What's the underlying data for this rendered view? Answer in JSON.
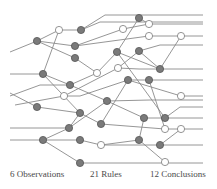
{
  "labels": {
    "observations": "6 Observations",
    "rules": "21 Rules",
    "conclusions": "12 Conclusions"
  },
  "colors": {
    "line": "#8a8a8a",
    "gray_node_fill": "#7a7a7a",
    "gray_node_stroke": "#555555",
    "white_node_fill": "#ffffff",
    "white_node_stroke": "#7a7a7a"
  },
  "nodes": [
    {
      "id": "a",
      "x": 37,
      "y": 41,
      "type": "gray"
    },
    {
      "id": "b",
      "x": 59,
      "y": 30,
      "type": "white"
    },
    {
      "id": "c",
      "x": 81,
      "y": 30,
      "type": "gray"
    },
    {
      "id": "d",
      "x": 75,
      "y": 46,
      "type": "gray"
    },
    {
      "id": "e",
      "x": 75,
      "y": 58,
      "type": "gray"
    },
    {
      "id": "f",
      "x": 43,
      "y": 74,
      "type": "gray"
    },
    {
      "id": "g",
      "x": 97,
      "y": 73,
      "type": "white"
    },
    {
      "id": "h",
      "x": 70,
      "y": 85,
      "type": "gray"
    },
    {
      "id": "i",
      "x": 64,
      "y": 96,
      "type": "white"
    },
    {
      "id": "j",
      "x": 139,
      "y": 18,
      "type": "gray"
    },
    {
      "id": "k",
      "x": 149,
      "y": 24,
      "type": "white"
    },
    {
      "id": "l",
      "x": 123,
      "y": 29,
      "type": "white"
    },
    {
      "id": "m",
      "x": 149,
      "y": 36,
      "type": "white"
    },
    {
      "id": "n",
      "x": 181,
      "y": 36,
      "type": "white"
    },
    {
      "id": "o",
      "x": 117,
      "y": 52,
      "type": "gray"
    },
    {
      "id": "p",
      "x": 139,
      "y": 51,
      "type": "gray"
    },
    {
      "id": "q",
      "x": 118,
      "y": 68,
      "type": "white"
    },
    {
      "id": "r",
      "x": 160,
      "y": 69,
      "type": "gray"
    },
    {
      "id": "s",
      "x": 128,
      "y": 80,
      "type": "gray"
    },
    {
      "id": "t",
      "x": 149,
      "y": 80,
      "type": "gray"
    },
    {
      "id": "u",
      "x": 107,
      "y": 101,
      "type": "gray"
    },
    {
      "id": "v",
      "x": 37,
      "y": 107,
      "type": "gray"
    },
    {
      "id": "w",
      "x": 80,
      "y": 113,
      "type": "gray"
    },
    {
      "id": "x",
      "x": 69,
      "y": 128,
      "type": "gray"
    },
    {
      "id": "y",
      "x": 101,
      "y": 124,
      "type": "gray"
    },
    {
      "id": "z",
      "x": 43,
      "y": 140,
      "type": "gray"
    },
    {
      "id": "aa",
      "x": 80,
      "y": 140,
      "type": "gray"
    },
    {
      "id": "ab",
      "x": 101,
      "y": 145,
      "type": "white"
    },
    {
      "id": "ac",
      "x": 80,
      "y": 163,
      "type": "gray"
    },
    {
      "id": "ad",
      "x": 181,
      "y": 96,
      "type": "white"
    },
    {
      "id": "ae",
      "x": 144,
      "y": 118,
      "type": "gray"
    },
    {
      "id": "af",
      "x": 165,
      "y": 118,
      "type": "gray"
    },
    {
      "id": "ag",
      "x": 165,
      "y": 129,
      "type": "white"
    },
    {
      "id": "ah",
      "x": 181,
      "y": 129,
      "type": "white"
    },
    {
      "id": "ai",
      "x": 139,
      "y": 140,
      "type": "gray"
    },
    {
      "id": "aj",
      "x": 160,
      "y": 145,
      "type": "gray"
    },
    {
      "id": "ak",
      "x": 165,
      "y": 162,
      "type": "white"
    }
  ],
  "edges": [
    [
      10,
      52,
      37,
      41
    ],
    [
      37,
      41,
      59,
      30
    ],
    [
      59,
      30,
      81,
      30
    ],
    [
      37,
      41,
      75,
      46
    ],
    [
      37,
      41,
      75,
      58
    ],
    [
      59,
      30,
      43,
      74
    ],
    [
      81,
      30,
      105,
      15
    ],
    [
      105,
      15,
      203,
      15
    ],
    [
      139,
      18,
      149,
      24
    ],
    [
      81,
      30,
      100,
      22
    ],
    [
      100,
      22,
      203,
      22
    ],
    [
      75,
      46,
      123,
      29
    ],
    [
      123,
      29,
      149,
      24
    ],
    [
      149,
      24,
      203,
      24
    ],
    [
      75,
      46,
      149,
      36
    ],
    [
      149,
      36,
      181,
      36
    ],
    [
      181,
      36,
      203,
      36
    ],
    [
      75,
      58,
      97,
      73
    ],
    [
      97,
      73,
      117,
      52
    ],
    [
      117,
      52,
      139,
      18
    ],
    [
      10,
      74,
      43,
      74
    ],
    [
      43,
      74,
      70,
      85
    ],
    [
      70,
      85,
      107,
      101
    ],
    [
      43,
      74,
      80,
      113
    ],
    [
      10,
      96,
      40,
      85
    ],
    [
      40,
      85,
      70,
      85
    ],
    [
      70,
      85,
      97,
      73
    ],
    [
      15,
      105,
      64,
      96
    ],
    [
      64,
      96,
      118,
      68
    ],
    [
      118,
      68,
      139,
      51
    ],
    [
      139,
      51,
      160,
      45
    ],
    [
      160,
      45,
      203,
      45
    ],
    [
      64,
      96,
      80,
      96
    ],
    [
      80,
      96,
      128,
      80
    ],
    [
      128,
      80,
      149,
      80
    ],
    [
      149,
      80,
      203,
      80
    ],
    [
      117,
      52,
      160,
      69
    ],
    [
      160,
      69,
      181,
      36
    ],
    [
      118,
      68,
      139,
      69
    ],
    [
      139,
      69,
      203,
      69
    ],
    [
      139,
      51,
      160,
      69
    ],
    [
      10,
      93,
      37,
      107
    ],
    [
      37,
      107,
      80,
      113
    ],
    [
      80,
      113,
      69,
      128
    ],
    [
      80,
      113,
      101,
      124
    ],
    [
      10,
      128,
      69,
      128
    ],
    [
      69,
      128,
      107,
      101
    ],
    [
      107,
      101,
      150,
      100
    ],
    [
      150,
      100,
      203,
      100
    ],
    [
      10,
      140,
      43,
      140
    ],
    [
      43,
      140,
      80,
      140
    ],
    [
      43,
      140,
      69,
      128
    ],
    [
      43,
      140,
      80,
      163
    ],
    [
      80,
      140,
      101,
      145
    ],
    [
      101,
      145,
      139,
      140
    ],
    [
      101,
      145,
      203,
      145
    ],
    [
      80,
      163,
      203,
      163
    ],
    [
      107,
      101,
      144,
      118
    ],
    [
      144,
      118,
      165,
      118
    ],
    [
      165,
      118,
      203,
      118
    ],
    [
      101,
      124,
      165,
      129
    ],
    [
      165,
      129,
      181,
      129
    ],
    [
      181,
      129,
      203,
      129
    ],
    [
      101,
      124,
      128,
      80
    ],
    [
      128,
      80,
      181,
      96
    ],
    [
      181,
      96,
      203,
      96
    ],
    [
      149,
      80,
      165,
      129
    ],
    [
      165,
      118,
      180,
      107
    ],
    [
      180,
      107,
      203,
      107
    ],
    [
      139,
      140,
      144,
      118
    ],
    [
      139,
      140,
      165,
      162
    ],
    [
      160,
      145,
      181,
      129
    ],
    [
      117,
      52,
      165,
      118
    ]
  ]
}
